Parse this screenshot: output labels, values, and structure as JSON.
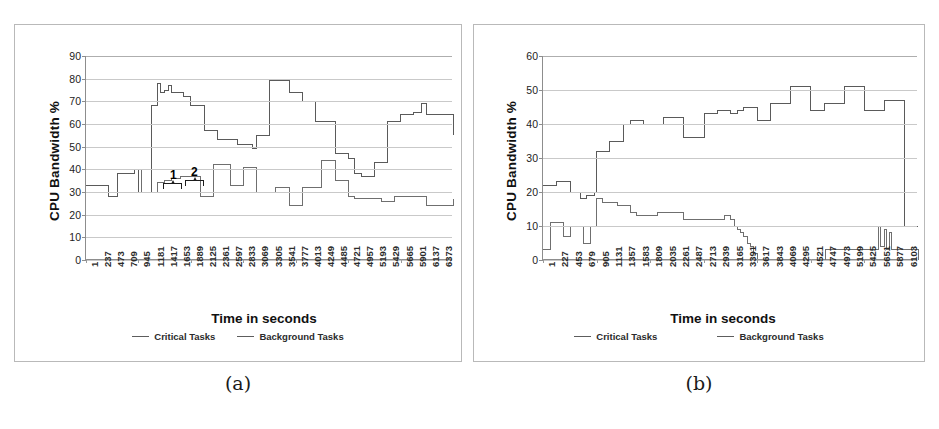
{
  "figure": {
    "panels": [
      {
        "id": "a",
        "caption": "(a)",
        "ylabel": "CPU Bandwidth %",
        "xlabel": "Time in seconds",
        "legend": [
          {
            "label": "Critical Tasks",
            "color": "#6f6f6f"
          },
          {
            "label": "Background Tasks",
            "color": "#5a5a5a"
          }
        ],
        "annotations": [
          {
            "label": "1"
          },
          {
            "label": "2"
          }
        ]
      },
      {
        "id": "b",
        "caption": "(b)",
        "ylabel": "CPU Bandwidth %",
        "xlabel": "Time in seconds",
        "legend": [
          {
            "label": "Critical Tasks",
            "color": "#6f6f6f"
          },
          {
            "label": "Background Tasks",
            "color": "#5a5a5a"
          }
        ],
        "annotations": []
      }
    ]
  },
  "chart_data": [
    {
      "type": "line",
      "panel": "a",
      "title": "(a)",
      "xlabel": "Time in seconds",
      "ylabel": "CPU Bandwidth %",
      "ylim": [
        0,
        90
      ],
      "ytick_step": 10,
      "yticks": [
        90,
        80,
        70,
        60,
        50,
        40,
        30,
        20,
        10,
        0
      ],
      "grid": true,
      "legend_position": "bottom",
      "xticks": [
        1,
        237,
        473,
        709,
        945,
        1181,
        1417,
        1653,
        1889,
        2125,
        2361,
        2597,
        2833,
        3069,
        3305,
        3541,
        3777,
        4013,
        4249,
        4485,
        4721,
        4957,
        5193,
        5429,
        5665,
        5901,
        6137,
        6373
      ],
      "xlim": [
        1,
        6609
      ],
      "annotations": [
        {
          "text": "1",
          "x": 1300,
          "y": 44,
          "note": "brace marking first critical-task step"
        },
        {
          "text": "2",
          "x": 1560,
          "y": 44,
          "note": "brace marking second critical-task step"
        }
      ],
      "series": [
        {
          "name": "Critical Tasks",
          "step": true,
          "x": [
            1,
            250,
            400,
            560,
            700,
            870,
            945,
            1000,
            1180,
            1280,
            1420,
            1540,
            1650,
            1700,
            1890,
            2060,
            2130,
            2300,
            2360,
            2600,
            2720,
            2840,
            3000,
            3070,
            3300,
            3420,
            3540,
            3660,
            3780,
            3900,
            4020,
            4140,
            4250,
            4420,
            4490,
            4600,
            4720,
            4840,
            4960,
            5080,
            5200,
            5320,
            5430,
            5560,
            5670,
            5900,
            6140,
            6380,
            6609
          ],
          "y": [
            33,
            33,
            28,
            38,
            38,
            40,
            40,
            30,
            30,
            34,
            35,
            36,
            36,
            37,
            37,
            28,
            28,
            42,
            42,
            33,
            33,
            41,
            41,
            30,
            30,
            32,
            32,
            24,
            24,
            32,
            32,
            32,
            44,
            44,
            35,
            35,
            28,
            27,
            27,
            27,
            27,
            26,
            26,
            28,
            28,
            28,
            24,
            24,
            27
          ]
        },
        {
          "name": "Background Tasks",
          "step": true,
          "x": [
            1,
            250,
            400,
            560,
            700,
            870,
            945,
            1000,
            1180,
            1280,
            1350,
            1420,
            1480,
            1540,
            1650,
            1760,
            1890,
            2060,
            2130,
            2300,
            2360,
            2600,
            2720,
            2840,
            3000,
            3070,
            3200,
            3300,
            3420,
            3540,
            3660,
            3780,
            3900,
            4020,
            4140,
            4250,
            4420,
            4490,
            4600,
            4720,
            4840,
            4960,
            5080,
            5200,
            5320,
            5430,
            5560,
            5670,
            5900,
            6050,
            6140,
            6300,
            6380,
            6609
          ],
          "y": [
            33,
            33,
            28,
            38,
            38,
            40,
            30,
            30,
            68,
            78,
            74,
            75,
            77,
            74,
            74,
            72,
            68,
            68,
            57,
            57,
            53,
            53,
            51,
            51,
            49,
            55,
            55,
            79,
            79,
            79,
            74,
            74,
            70,
            70,
            61,
            61,
            61,
            47,
            47,
            45,
            38,
            37,
            37,
            43,
            43,
            61,
            61,
            64,
            65,
            69,
            64,
            64,
            64,
            55
          ]
        }
      ]
    },
    {
      "type": "line",
      "panel": "b",
      "title": "(b)",
      "xlabel": "Time in seconds",
      "ylabel": "CPU Bandwidth %",
      "ylim": [
        0,
        60
      ],
      "ytick_step": 10,
      "yticks": [
        60,
        50,
        40,
        30,
        20,
        10,
        0
      ],
      "grid": true,
      "legend_position": "bottom",
      "xticks": [
        1,
        227,
        453,
        679,
        905,
        1131,
        1357,
        1583,
        1809,
        2035,
        2261,
        2487,
        2713,
        2939,
        3165,
        3391,
        3617,
        3843,
        4069,
        4295,
        4521,
        4747,
        4973,
        5199,
        5425,
        5651,
        5877,
        6103
      ],
      "xlim": [
        1,
        6329
      ],
      "annotations": [],
      "series": [
        {
          "name": "Critical Tasks",
          "step": true,
          "x": [
            1,
            120,
            230,
            350,
            460,
            560,
            640,
            690,
            740,
            800,
            905,
            1010,
            1130,
            1250,
            1360,
            1470,
            1580,
            1700,
            1810,
            1930,
            2040,
            2260,
            2380,
            2490,
            2600,
            2720,
            2830,
            2940,
            3060,
            3165,
            3230,
            3290,
            3340,
            3390,
            3450,
            3500,
            3560,
            3617,
            3700,
            4700,
            4760,
            4900,
            5000,
            5200,
            5400,
            5600,
            5660,
            5700,
            5760,
            5800,
            5850,
            5880,
            5950,
            6000,
            6103,
            6329
          ],
          "y": [
            3,
            11,
            11,
            7,
            10,
            10,
            10,
            5,
            5,
            10,
            18,
            17,
            17,
            16,
            16,
            14,
            13,
            13,
            13,
            14,
            14,
            14,
            12,
            12,
            12,
            12,
            12,
            12,
            13,
            12,
            10,
            9,
            8,
            7,
            5,
            4,
            2,
            0,
            0,
            0,
            3,
            3,
            3,
            3,
            3,
            3,
            10,
            4,
            9,
            3,
            8,
            3,
            3,
            3,
            3,
            0
          ]
        },
        {
          "name": "Background Tasks",
          "step": true,
          "x": [
            1,
            120,
            230,
            350,
            460,
            560,
            640,
            690,
            740,
            800,
            870,
            905,
            1010,
            1130,
            1250,
            1360,
            1470,
            1580,
            1700,
            1810,
            1930,
            2040,
            2150,
            2260,
            2380,
            2490,
            2600,
            2720,
            2830,
            2940,
            3060,
            3165,
            3280,
            3390,
            3500,
            3617,
            3730,
            3843,
            3960,
            4069,
            4180,
            4295,
            4410,
            4521,
            4630,
            4747,
            4860,
            4973,
            5090,
            5199,
            5310,
            5425,
            5540,
            5651,
            5760,
            5877,
            5990,
            6103,
            6329
          ],
          "y": [
            22,
            22,
            23,
            23,
            20,
            20,
            18,
            18,
            19,
            19,
            20,
            32,
            32,
            35,
            35,
            40,
            41,
            41,
            40,
            40,
            40,
            42,
            42,
            42,
            36,
            36,
            36,
            43,
            43,
            44,
            44,
            43,
            44,
            45,
            45,
            41,
            41,
            46,
            46,
            46,
            51,
            51,
            51,
            44,
            44,
            46,
            46,
            46,
            51,
            51,
            51,
            44,
            44,
            44,
            47,
            47,
            47,
            10,
            10
          ]
        }
      ]
    }
  ]
}
